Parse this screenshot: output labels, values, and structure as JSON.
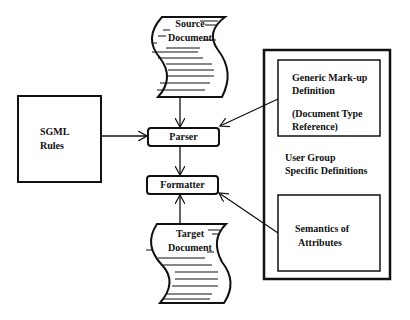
{
  "diagram": {
    "nodes": {
      "source_document": {
        "line1": "Source",
        "line2": "Document"
      },
      "target_document": {
        "line1": "Target",
        "line2": "Document"
      },
      "sgml_rules": {
        "line1": "SGML",
        "line2": "Rules"
      },
      "parser": {
        "label": "Parser"
      },
      "formatter": {
        "label": "Formatter"
      },
      "gmd": {
        "line1": "Generic Mark-up",
        "line2": "Definition",
        "line3": "(Document Type",
        "line4": "Reference)"
      },
      "user_group": {
        "line1": "User Group",
        "line2": "Specific Definitions"
      },
      "semantics": {
        "line1": "Semantics of",
        "line2": "Attributes"
      }
    },
    "edges": [
      {
        "from": "Source Document",
        "to": "Parser"
      },
      {
        "from": "SGML Rules",
        "to": "Parser"
      },
      {
        "from": "Generic Mark-up Definition",
        "to": "Parser"
      },
      {
        "from": "Parser",
        "to": "Formatter"
      },
      {
        "from": "Target Document",
        "to": "Formatter"
      },
      {
        "from": "Semantics of Attributes",
        "to": "Formatter"
      }
    ]
  }
}
